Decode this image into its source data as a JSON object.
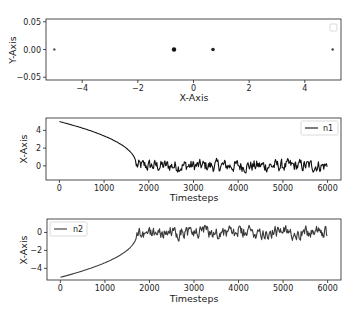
{
  "chart_data": [
    {
      "type": "scatter",
      "title": "",
      "xlabel": "X-Axis",
      "ylabel": "Y-Axis",
      "xlim": [
        -5.3,
        5.3
      ],
      "ylim": [
        -0.055,
        0.055
      ],
      "xticks": [
        -4,
        -2,
        0,
        2,
        4
      ],
      "xtick_labels": [
        "−4",
        "−2",
        "0",
        "2",
        "4"
      ],
      "yticks": [
        0.05,
        0.0,
        -0.05
      ],
      "ytick_labels": [
        "0.05",
        "0.00",
        "−0.05"
      ],
      "grid": false,
      "legend": {
        "position": "upper right",
        "entries": []
      },
      "points": [
        {
          "x": -5.0,
          "y": 0.0,
          "size": 1.2,
          "color": "#555555"
        },
        {
          "x": -0.7,
          "y": 0.0,
          "size": 2.2,
          "color": "#111111"
        },
        {
          "x": 0.7,
          "y": 0.0,
          "size": 1.8,
          "color": "#222222"
        },
        {
          "x": 5.0,
          "y": 0.0,
          "size": 1.2,
          "color": "#444444"
        }
      ]
    },
    {
      "type": "line",
      "title": "",
      "xlabel": "Timesteps",
      "ylabel": "X-Axis",
      "xlim": [
        -300,
        6300
      ],
      "ylim": [
        -1.6,
        5.4
      ],
      "xticks": [
        0,
        1000,
        2000,
        3000,
        4000,
        5000,
        6000
      ],
      "xtick_labels": [
        "0",
        "1000",
        "2000",
        "3000",
        "4000",
        "5000",
        "6000"
      ],
      "yticks": [
        4,
        2,
        0
      ],
      "ytick_labels": [
        "4",
        "2",
        "0"
      ],
      "grid": false,
      "legend": {
        "position": "upper right",
        "entries": [
          "n1"
        ]
      },
      "series": [
        {
          "name": "n1",
          "color": "#111111",
          "description": "Decays from 5 at t=0 to ~0 at t~1720, then oscillates noisily around 0 with amplitude ~1 until t=6000",
          "start": 5.0,
          "transition_t": 1720,
          "steady_mean": 0.0,
          "noise_amplitude": 1.1,
          "sign": 1
        }
      ]
    },
    {
      "type": "line",
      "title": "",
      "xlabel": "Timesteps",
      "ylabel": "X-Axis",
      "xlim": [
        -300,
        6300
      ],
      "ylim": [
        -5.3,
        1.5
      ],
      "xticks": [
        0,
        1000,
        2000,
        3000,
        4000,
        5000,
        6000
      ],
      "xtick_labels": [
        "0",
        "1000",
        "2000",
        "3000",
        "4000",
        "5000",
        "6000"
      ],
      "yticks": [
        0,
        -2,
        -4
      ],
      "ytick_labels": [
        "0",
        "−2",
        "−4"
      ],
      "grid": false,
      "legend": {
        "position": "upper left",
        "entries": [
          "n2"
        ]
      },
      "series": [
        {
          "name": "n2",
          "color": "#3a3a3a",
          "description": "Rises from -5 at t=0 to ~0 at t~1720, then oscillates noisily around 0 with amplitude ~1 until t=6000",
          "start": -5.0,
          "transition_t": 1720,
          "steady_mean": 0.0,
          "noise_amplitude": 1.1,
          "sign": -1
        }
      ]
    }
  ]
}
